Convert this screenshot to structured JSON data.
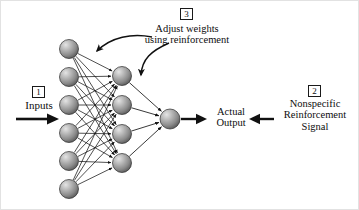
{
  "figure": {
    "type": "neural-network-diagram",
    "background_color": "#ffffff",
    "ink_color": "#111111"
  },
  "markers": {
    "one": "1",
    "two": "2",
    "three": "3"
  },
  "labels": {
    "inputs": "Inputs",
    "adjust_line1": "Adjust weights",
    "adjust_line2": "using reinforcement",
    "actual_line1": "Actual",
    "actual_line2": "Output",
    "nonspecific_line1": "Nonspecific",
    "nonspecific_line2": "Reinforcement",
    "nonspecific_line3": "Signal"
  },
  "network": {
    "node_fill_light": "#d8d8d8",
    "node_fill_mid": "#8e8e8e",
    "node_fill_dark": "#4a4a4a",
    "node_stroke": "#2a2a2a",
    "edge_color": "#1a1a1a",
    "input_layer": {
      "name": "input-layer",
      "count": 6,
      "radius": 9.5,
      "x": 68,
      "y": [
        48,
        76,
        104,
        132,
        160,
        188
      ]
    },
    "hidden_layer": {
      "name": "hidden-layer",
      "count": 4,
      "radius": 9.5,
      "x": 121,
      "y": [
        75,
        104,
        133,
        162
      ]
    },
    "output_layer": {
      "name": "output-layer",
      "count": 1,
      "radius": 10,
      "x": 169,
      "y": [
        118
      ]
    }
  },
  "arrows": {
    "input_arrow": "thick-right-arrow",
    "output_arrow": "thick-right-arrow",
    "reinforcement_arrow": "thick-left-arrow",
    "adjust_arrow_left": "curved-arrow-to-input-weights",
    "adjust_arrow_right": "curved-arrow-to-hidden-weights"
  }
}
